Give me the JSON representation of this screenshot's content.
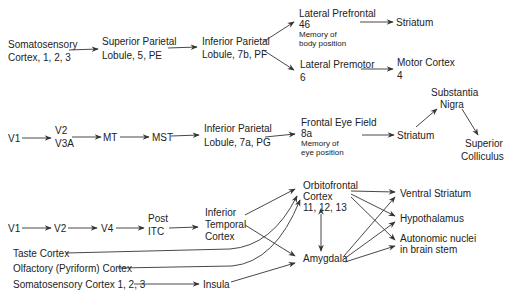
{
  "pathway_1": {
    "somatosensory": [
      "Somatosensory",
      "Cortex,  1, 2, 3"
    ],
    "superior_parietal": [
      "Superior Parietal",
      "Lobule,  5, PE"
    ],
    "inferior_parietal": [
      "Inferior Parietal",
      "Lobule, 7b, PF"
    ],
    "lateral_prefrontal": [
      "Lateral Prefrontal",
      "46"
    ],
    "lateral_prefrontal_note": [
      "Memory of",
      "body position"
    ],
    "striatum": "Striatum",
    "lateral_premotor": [
      "Lateral Premotor",
      "6"
    ],
    "motor_cortex": [
      "Motor Cortex",
      "4"
    ]
  },
  "pathway_2": {
    "v1": "V1",
    "v2_v3a": [
      "V2",
      "V3A"
    ],
    "mt": "MT",
    "mst": "MST",
    "inferior_parietal": [
      "Inferior Parietal",
      "Lobule,  7a, PG"
    ],
    "frontal_eye_field": [
      "Frontal Eye Field",
      "8a"
    ],
    "frontal_eye_field_note": [
      "Memory of",
      "eye position"
    ],
    "striatum": "Striatum",
    "substantia_nigra": [
      "Substantia",
      "Nigra"
    ],
    "superior_colliculus": [
      "Superior",
      "Colliculus"
    ]
  },
  "pathway_3": {
    "v1": "V1",
    "v2": "V2",
    "v4": "V4",
    "post_itc": [
      "Post",
      "ITC"
    ],
    "inferior_temporal": [
      "Inferior",
      "Temporal",
      "Cortex"
    ],
    "taste_cortex": "Taste Cortex",
    "olfactory_cortex": "Olfactory (Pyriform) Cortex",
    "somatosensory": "Somatosensory  Cortex  1, 2, 3",
    "insula": "Insula",
    "orbitofrontal": [
      "Orbitofrontal",
      "Cortex",
      "11, 12, 13"
    ],
    "amygdala": "Amygdala",
    "ventral_striatum": "Ventral Striatum",
    "hypothalamus": "Hypothalamus",
    "autonomic_nuclei": [
      "Autonomic nuclei",
      "in brain stem"
    ]
  }
}
